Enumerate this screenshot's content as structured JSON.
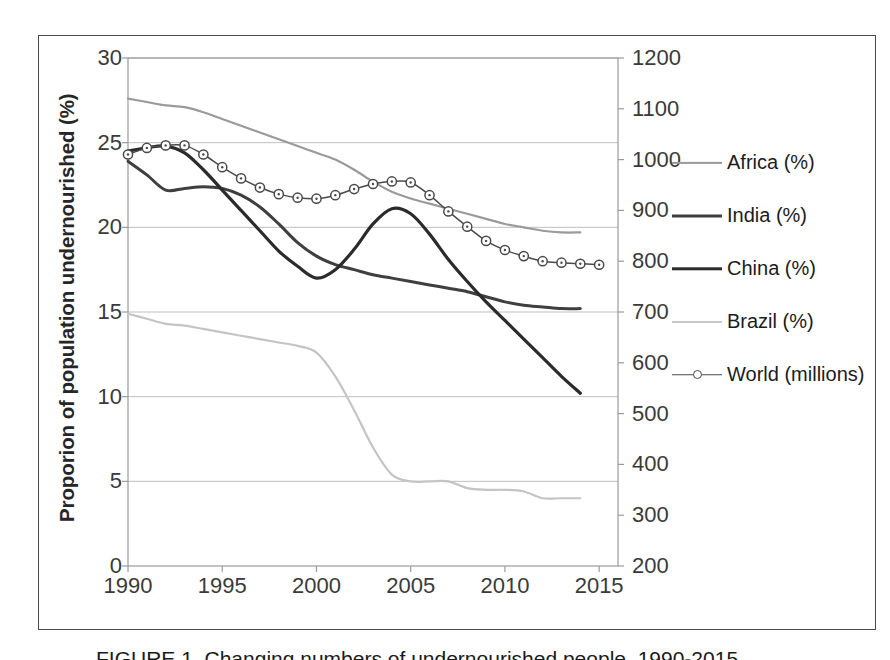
{
  "chart_data": {
    "type": "line",
    "title": "",
    "xlabel": "",
    "ylabel": "Proporion of population undernourished (%)",
    "ylabel_right": "",
    "xlim": [
      1990,
      2016
    ],
    "ylim": [
      0,
      30
    ],
    "ylim_right": [
      200,
      1200
    ],
    "grid": true,
    "grid_axis": "y",
    "legend_position": "right",
    "xticks": [
      1990,
      1995,
      2000,
      2005,
      2010,
      2015
    ],
    "yticks_left": [
      0,
      5,
      10,
      15,
      20,
      25,
      30
    ],
    "yticks_right": [
      200,
      300,
      400,
      500,
      600,
      700,
      800,
      900,
      1000,
      1100,
      1200
    ],
    "series": [
      {
        "name": "Africa (%)",
        "axis": "left",
        "color": "#9a9a9a",
        "width": 2.2,
        "marker": "none",
        "x": [
          1990,
          1991,
          1992,
          1993,
          1994,
          1995,
          1996,
          1997,
          1998,
          1999,
          2000,
          2001,
          2002,
          2003,
          2004,
          2005,
          2006,
          2007,
          2008,
          2009,
          2010,
          2011,
          2012,
          2013,
          2014
        ],
        "values": [
          27.6,
          27.4,
          27.2,
          27.1,
          26.8,
          26.4,
          26.0,
          25.6,
          25.2,
          24.8,
          24.4,
          24.0,
          23.4,
          22.7,
          22.1,
          21.7,
          21.4,
          21.1,
          20.8,
          20.5,
          20.2,
          20.0,
          19.8,
          19.7,
          19.7
        ]
      },
      {
        "name": "India (%)",
        "axis": "left",
        "color": "#3f3f3f",
        "width": 3.0,
        "marker": "none",
        "x": [
          1990,
          1991,
          1992,
          1993,
          1994,
          1995,
          1996,
          1997,
          1998,
          1999,
          2000,
          2001,
          2002,
          2003,
          2004,
          2005,
          2006,
          2007,
          2008,
          2009,
          2010,
          2011,
          2012,
          2013,
          2014
        ],
        "values": [
          23.9,
          23.1,
          22.2,
          22.3,
          22.4,
          22.3,
          21.9,
          21.2,
          20.2,
          19.1,
          18.3,
          17.8,
          17.5,
          17.2,
          17.0,
          16.8,
          16.6,
          16.4,
          16.2,
          15.9,
          15.6,
          15.4,
          15.3,
          15.2,
          15.2
        ]
      },
      {
        "name": "China (%)",
        "axis": "left",
        "color": "#2b2b2b",
        "width": 3.2,
        "marker": "none",
        "x": [
          1990,
          1991,
          1992,
          1993,
          1994,
          1995,
          1996,
          1997,
          1998,
          1999,
          2000,
          2001,
          2002,
          2003,
          2004,
          2005,
          2006,
          2007,
          2008,
          2009,
          2010,
          2011,
          2012,
          2013,
          2014
        ],
        "values": [
          24.5,
          24.7,
          24.8,
          24.4,
          23.4,
          22.2,
          21.0,
          19.8,
          18.6,
          17.7,
          17.0,
          17.5,
          18.7,
          20.2,
          21.1,
          20.8,
          19.6,
          18.1,
          16.8,
          15.6,
          14.5,
          13.4,
          12.3,
          11.2,
          10.2
        ]
      },
      {
        "name": "Brazil (%)",
        "axis": "left",
        "color": "#c4c4c4",
        "width": 2.2,
        "marker": "none",
        "x": [
          1990,
          1991,
          1992,
          1993,
          1994,
          1995,
          1996,
          1997,
          1998,
          1999,
          2000,
          2001,
          2002,
          2003,
          2004,
          2005,
          2006,
          2007,
          2008,
          2009,
          2010,
          2011,
          2012,
          2013,
          2014
        ],
        "values": [
          14.9,
          14.6,
          14.3,
          14.2,
          14.0,
          13.8,
          13.6,
          13.4,
          13.2,
          13.0,
          12.6,
          11.2,
          9.2,
          7.0,
          5.4,
          5.0,
          5.0,
          5.0,
          4.6,
          4.5,
          4.5,
          4.4,
          4.0,
          4.0,
          4.0
        ]
      },
      {
        "name": "World (millions)",
        "axis": "right",
        "color": "#4a4a4a",
        "width": 1.5,
        "marker": "circle-open",
        "x": [
          1990,
          1991,
          1992,
          1993,
          1994,
          1995,
          1996,
          1997,
          1998,
          1999,
          2000,
          2001,
          2002,
          2003,
          2004,
          2005,
          2006,
          2007,
          2008,
          2009,
          2010,
          2011,
          2012,
          2013,
          2014,
          2015
        ],
        "values": [
          1010,
          1023,
          1028,
          1028,
          1010,
          985,
          963,
          945,
          932,
          925,
          923,
          930,
          942,
          952,
          957,
          955,
          930,
          898,
          868,
          840,
          822,
          810,
          800,
          797,
          795,
          793
        ]
      }
    ],
    "note_left_series_mapped_on_left_axis": [
      "Africa (%)",
      "India (%)",
      "China (%)",
      "Brazil (%)"
    ],
    "note_right_series_mapped_on_right_axis": [
      "World (millions)"
    ]
  },
  "axes": {
    "left_title": "Proporion of population undernourished (%)",
    "left_ticks": [
      "30",
      "25",
      "20",
      "15",
      "10",
      "5",
      "0"
    ],
    "right_ticks": [
      "1200",
      "1100",
      "1000",
      "900",
      "800",
      "700",
      "600",
      "500",
      "400",
      "300",
      "200"
    ],
    "x_ticks": [
      "1990",
      "1995",
      "2000",
      "2005",
      "2010",
      "2015"
    ]
  },
  "legend": {
    "items": [
      {
        "label": "Africa (%)",
        "color": "#9a9a9a",
        "width": 2.2,
        "marker": false
      },
      {
        "label": "India (%)",
        "color": "#3f3f3f",
        "width": 3.0,
        "marker": false
      },
      {
        "label": "China (%)",
        "color": "#2b2b2b",
        "width": 3.4,
        "marker": false
      },
      {
        "label": "Brazil (%)",
        "color": "#c8c8c8",
        "width": 2.0,
        "marker": false
      },
      {
        "label": "World (millions)",
        "color": "#4a4a4a",
        "width": 1.5,
        "marker": true
      }
    ]
  },
  "caption": {
    "text": "FIGURE 1.  Changing numbers of undernourished people, 1990-2015."
  },
  "colors": {
    "frame": "#4a4a4a",
    "grid": "#bfbfbf",
    "plot_border": "#9b9b9b",
    "text": "#262626"
  }
}
